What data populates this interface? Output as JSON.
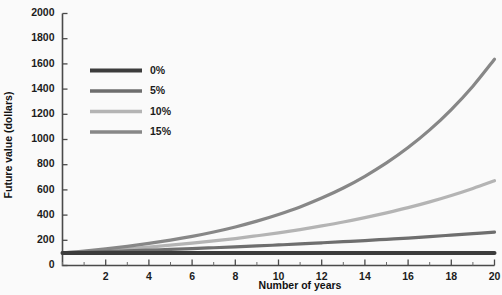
{
  "chart_data": {
    "type": "line",
    "title": "",
    "xlabel": "Number of years",
    "ylabel": "Future value (dollars)",
    "xlim": [
      0,
      20
    ],
    "ylim": [
      0,
      2000
    ],
    "grid": false,
    "legend_position": "upper-left-inside",
    "x_ticks": [
      2,
      4,
      6,
      8,
      10,
      12,
      14,
      16,
      18,
      20
    ],
    "x_tick_labels": [
      "2",
      "4",
      "6",
      "8",
      "10",
      "12",
      "14",
      "16",
      "18",
      "20"
    ],
    "x_minor_step": 1,
    "y_ticks": [
      0,
      200,
      400,
      600,
      800,
      1000,
      1200,
      1400,
      1600,
      1800,
      2000
    ],
    "y_tick_labels": [
      "0",
      "200",
      "400",
      "600",
      "800",
      "1000",
      "1200",
      "1400",
      "1600",
      "1800",
      "2000"
    ],
    "x": [
      0,
      1,
      2,
      3,
      4,
      5,
      6,
      7,
      8,
      9,
      10,
      11,
      12,
      13,
      14,
      15,
      16,
      17,
      18,
      19,
      20
    ],
    "series": [
      {
        "name": "0%",
        "color": "#3c3c3c",
        "values": [
          100,
          100,
          100,
          100,
          100,
          100,
          100,
          100,
          100,
          100,
          100,
          100,
          100,
          100,
          100,
          100,
          100,
          100,
          100,
          100,
          100
        ]
      },
      {
        "name": "5%",
        "color": "#6e6e6e",
        "values": [
          100,
          105,
          110,
          116,
          122,
          128,
          134,
          141,
          148,
          155,
          163,
          171,
          180,
          189,
          198,
          208,
          218,
          229,
          241,
          253,
          265
        ]
      },
      {
        "name": "10%",
        "color": "#b4b4b4",
        "values": [
          100,
          110,
          121,
          133,
          146,
          161,
          177,
          195,
          214,
          236,
          259,
          285,
          314,
          345,
          380,
          418,
          459,
          505,
          556,
          612,
          673
        ]
      },
      {
        "name": "15%",
        "color": "#878787",
        "values": [
          100,
          115,
          132,
          152,
          175,
          201,
          231,
          266,
          306,
          352,
          405,
          465,
          535,
          615,
          708,
          814,
          936,
          1076,
          1238,
          1423,
          1637
        ]
      }
    ]
  },
  "legend": {
    "entries": [
      "0%",
      "5%",
      "10%",
      "15%"
    ]
  },
  "axes": {
    "x_title": "Number of years",
    "y_title": "Future value (dollars)"
  }
}
